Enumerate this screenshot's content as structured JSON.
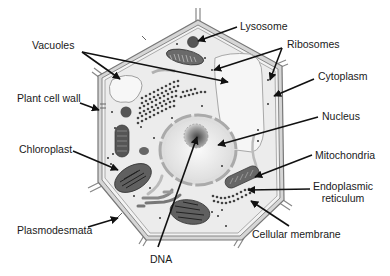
{
  "diagram": {
    "subject": "Plant cell",
    "labels": {
      "vacuoles": "Vacuoles",
      "plant_cell_wall": "Plant cell wall",
      "chloroplast": "Chloroplast",
      "plasmodesmata": "Plasmodesmata",
      "dna": "DNA",
      "lysosome": "Lysosome",
      "ribosomes": "Ribosomes",
      "cytoplasm": "Cytoplasm",
      "nucleus": "Nucleus",
      "mitochondria": "Mitochondria",
      "endoplasmic_reticulum_line1": "Endoplasmic",
      "endoplasmic_reticulum_line2": "reticulum",
      "cellular_membrane": "Cellular membrane"
    },
    "colors": {
      "text": "#1a1a1a",
      "arrow": "#111111",
      "cell_wall": "#8a8a8a",
      "cytoplasm_fill": "#ececec",
      "organelle_dark": "#5a5a5a",
      "vacuole_fill": "#f4f4f4"
    }
  }
}
